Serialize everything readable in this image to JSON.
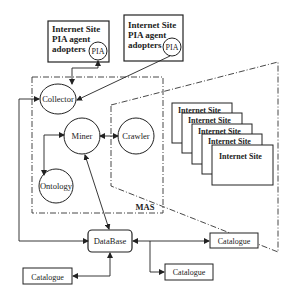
{
  "diagram": {
    "pia_boxes": [
      {
        "lines": [
          "Internet Site",
          "PIA agent",
          "adopters"
        ],
        "agent": "PIA"
      },
      {
        "lines": [
          "Internet Site",
          "PIA agent",
          "adopters"
        ],
        "agent": "PIA"
      }
    ],
    "mas": {
      "label": "MAS",
      "nodes": {
        "collector": "Collector",
        "miner": "Miner",
        "crawler": "Crawler",
        "ontology": "Ontology"
      }
    },
    "internet_sites": [
      "Internet Site",
      "Internet Site",
      "Internet Site",
      "Internet Site",
      "Internet Site"
    ],
    "database": "DataBase",
    "catalogues": [
      "Catalogue",
      "Catalogue",
      "Catalogue"
    ],
    "colors": {
      "stroke": "#222222",
      "background": "#ffffff"
    }
  }
}
